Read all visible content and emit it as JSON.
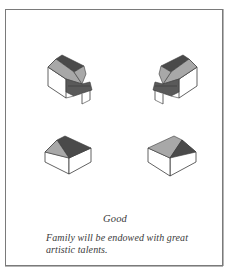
{
  "figure": {
    "illustrations": [
      {
        "id": "house-with-steps-left",
        "position": "top-left",
        "description": "isometric house with gabled roof and front steps extension, facing right"
      },
      {
        "id": "house-with-steps-right",
        "position": "top-right",
        "description": "isometric house with gabled roof and front steps extension, facing left"
      },
      {
        "id": "plain-house-left",
        "position": "bottom-left",
        "description": "isometric plain gabled house"
      },
      {
        "id": "plain-house-right",
        "position": "bottom-right",
        "description": "isometric plain gabled house, mirrored"
      }
    ],
    "colors": {
      "roof_dark": "#4a4a4a",
      "roof_light": "#a8a8a8",
      "wall": "#ffffff",
      "steps": "#5a5a5a",
      "outline": "#3a3a3a",
      "frame_border": "#7a7a7a"
    }
  },
  "caption": "Good",
  "description": "Family will be endowed with great artistic talents."
}
